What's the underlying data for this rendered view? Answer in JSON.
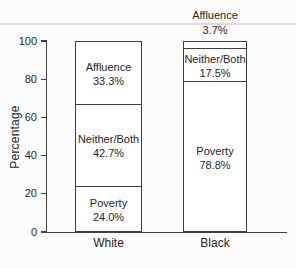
{
  "chart_data": {
    "type": "bar",
    "stacked": true,
    "title": "",
    "ylabel": "Percentage",
    "ylim": [
      0,
      100
    ],
    "yticks": [
      0,
      20,
      40,
      60,
      80,
      100
    ],
    "grid": false,
    "legend": "none (segments labeled in-bar)",
    "categories": [
      "White",
      "Black"
    ],
    "series": [
      {
        "name": "Poverty",
        "values": [
          24.0,
          78.8
        ],
        "value_labels": [
          "24.0%",
          "78.8%"
        ],
        "label_positions": [
          "inside",
          "inside"
        ]
      },
      {
        "name": "Neither/Both",
        "values": [
          42.7,
          17.5
        ],
        "value_labels": [
          "42.7%",
          "17.5%"
        ],
        "label_positions": [
          "inside",
          "inside"
        ]
      },
      {
        "name": "Affluence",
        "values": [
          33.3,
          3.7
        ],
        "value_labels": [
          "33.3%",
          "3.7%"
        ],
        "label_positions": [
          "inside",
          "above"
        ]
      }
    ],
    "colors": {
      "line": "#3f3f3f",
      "text": "#262626",
      "bar_fill": "#ffffff",
      "background": "#fcfcfc",
      "scan_line": "#dcdcdc"
    }
  }
}
